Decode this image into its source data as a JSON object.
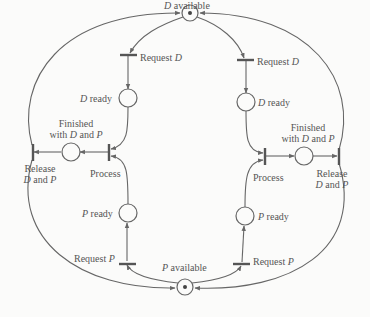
{
  "diagram": {
    "type": "petri-net",
    "colors": {
      "stroke": "#666666",
      "text": "#555555",
      "background": "#fbfbfa"
    },
    "places": {
      "d_available": {
        "label_var": "D",
        "label_rest": " available",
        "tokens": 1
      },
      "p_available": {
        "label_var": "P",
        "label_rest": " available",
        "tokens": 1
      },
      "left_d_ready": {
        "label_var": "D",
        "label_rest": " ready",
        "tokens": 0
      },
      "right_d_ready": {
        "label_var": "D",
        "label_rest": " ready",
        "tokens": 0
      },
      "left_p_ready": {
        "label_var": "P",
        "label_rest": " ready",
        "tokens": 0
      },
      "right_p_ready": {
        "label_var": "P",
        "label_rest": " ready",
        "tokens": 0
      },
      "left_finished": {
        "line1": "Finished",
        "line2_pre": "with ",
        "line2_var1": "D",
        "line2_mid": " and ",
        "line2_var2": "P",
        "tokens": 0
      },
      "right_finished": {
        "line1": "Finished",
        "line2_pre": "with ",
        "line2_var1": "D",
        "line2_mid": " and ",
        "line2_var2": "P",
        "tokens": 0
      }
    },
    "transitions": {
      "left_request_d": {
        "label_pre": "Request ",
        "label_var": "D"
      },
      "right_request_d": {
        "label_pre": "Request ",
        "label_var": "D"
      },
      "left_request_p": {
        "label_pre": "Request ",
        "label_var": "P"
      },
      "right_request_p": {
        "label_pre": "Request ",
        "label_var": "P"
      },
      "left_process": {
        "label": "Process"
      },
      "right_process": {
        "label": "Process"
      },
      "left_release": {
        "line1": "Release",
        "line2_var1": "D",
        "line2_mid": " and ",
        "line2_var2": "P"
      },
      "right_release": {
        "line1": "Release",
        "line2_var1": "D",
        "line2_mid": " and ",
        "line2_var2": "P"
      }
    }
  }
}
